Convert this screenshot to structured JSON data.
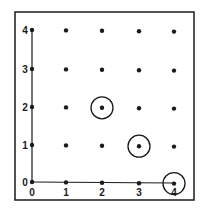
{
  "diagram": {
    "type": "lattice-grid",
    "x_ticks": [
      "0",
      "1",
      "2",
      "3",
      "4"
    ],
    "y_ticks": [
      "0",
      "1",
      "2",
      "3",
      "4"
    ],
    "points": [
      [
        0,
        0
      ],
      [
        1,
        0
      ],
      [
        2,
        0
      ],
      [
        3,
        0
      ],
      [
        4,
        0
      ],
      [
        0,
        1
      ],
      [
        1,
        1
      ],
      [
        2,
        1
      ],
      [
        3,
        1
      ],
      [
        4,
        1
      ],
      [
        0,
        2
      ],
      [
        1,
        2
      ],
      [
        2,
        2
      ],
      [
        3,
        2
      ],
      [
        4,
        2
      ],
      [
        0,
        3
      ],
      [
        1,
        3
      ],
      [
        2,
        3
      ],
      [
        3,
        3
      ],
      [
        4,
        3
      ],
      [
        0,
        4
      ],
      [
        1,
        4
      ],
      [
        2,
        4
      ],
      [
        3,
        4
      ],
      [
        4,
        4
      ]
    ],
    "circled_points": [
      [
        2,
        2
      ],
      [
        3,
        1
      ],
      [
        4,
        0
      ]
    ],
    "colors": {
      "ink": "#1a1a1a",
      "background": "#ffffff"
    }
  }
}
